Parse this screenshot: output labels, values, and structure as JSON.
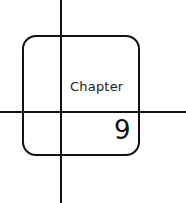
{
  "heading": {
    "label": "Chapter",
    "number": "9"
  },
  "colors": {
    "line": "#111111",
    "background": "#ffffff"
  }
}
